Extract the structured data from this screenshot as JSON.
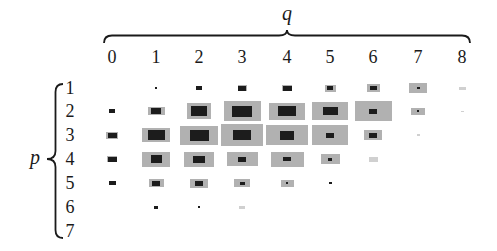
{
  "chart_data": {
    "type": "heatmap",
    "title": "",
    "xlabel": "q",
    "ylabel": "p",
    "x_ticks": [
      "0",
      "1",
      "2",
      "3",
      "4",
      "5",
      "6",
      "7",
      "8"
    ],
    "y_ticks": [
      "1",
      "2",
      "3",
      "4",
      "5",
      "6",
      "7"
    ],
    "grid": false,
    "legend": "none",
    "encoding": "each (p,q) cell drawn as a gray outer rectangle with a dark inner rectangle; sizes in px [w,h]",
    "colors": {
      "outer": "#b1b1b1",
      "outer_light": "#d0d0d0",
      "inner": "#1c1c1c"
    },
    "cells": [
      {
        "p": 1,
        "q": 1,
        "outer": [
          0,
          0
        ],
        "inner": [
          2,
          2
        ]
      },
      {
        "p": 1,
        "q": 2,
        "outer": [
          0,
          0
        ],
        "inner": [
          6,
          4
        ]
      },
      {
        "p": 1,
        "q": 3,
        "outer": [
          9,
          6
        ],
        "inner": [
          8,
          5
        ]
      },
      {
        "p": 1,
        "q": 4,
        "outer": [
          10,
          6
        ],
        "inner": [
          9,
          5
        ]
      },
      {
        "p": 1,
        "q": 5,
        "outer": [
          11,
          7
        ],
        "inner": [
          6,
          4
        ]
      },
      {
        "p": 1,
        "q": 6,
        "outer": [
          13,
          8
        ],
        "inner": [
          7,
          4
        ]
      },
      {
        "p": 1,
        "q": 7,
        "outer": [
          18,
          10
        ],
        "inner": [
          3,
          2
        ]
      },
      {
        "p": 1,
        "q": 8,
        "outer": [
          7,
          3
        ],
        "inner": [
          0,
          0
        ],
        "light": true
      },
      {
        "p": 2,
        "q": 0,
        "outer": [
          0,
          0
        ],
        "inner": [
          6,
          4
        ]
      },
      {
        "p": 2,
        "q": 1,
        "outer": [
          17,
          8
        ],
        "inner": [
          10,
          6
        ]
      },
      {
        "p": 2,
        "q": 2,
        "outer": [
          24,
          16
        ],
        "inner": [
          16,
          10
        ]
      },
      {
        "p": 2,
        "q": 3,
        "outer": [
          37,
          20
        ],
        "inner": [
          20,
          11
        ]
      },
      {
        "p": 2,
        "q": 4,
        "outer": [
          36,
          17
        ],
        "inner": [
          18,
          10
        ]
      },
      {
        "p": 2,
        "q": 5,
        "outer": [
          36,
          18
        ],
        "inner": [
          15,
          8
        ]
      },
      {
        "p": 2,
        "q": 6,
        "outer": [
          37,
          20
        ],
        "inner": [
          8,
          5
        ]
      },
      {
        "p": 2,
        "q": 7,
        "outer": [
          14,
          7
        ],
        "inner": [
          2,
          2
        ]
      },
      {
        "p": 2,
        "q": 8,
        "outer": [
          3,
          1
        ],
        "inner": [
          0,
          0
        ],
        "light": true
      },
      {
        "p": 3,
        "q": 0,
        "outer": [
          12,
          7
        ],
        "inner": [
          9,
          5
        ]
      },
      {
        "p": 3,
        "q": 1,
        "outer": [
          28,
          14
        ],
        "inner": [
          17,
          10
        ]
      },
      {
        "p": 3,
        "q": 2,
        "outer": [
          38,
          19
        ],
        "inner": [
          19,
          11
        ]
      },
      {
        "p": 3,
        "q": 3,
        "outer": [
          42,
          22
        ],
        "inner": [
          18,
          10
        ]
      },
      {
        "p": 3,
        "q": 4,
        "outer": [
          42,
          20
        ],
        "inner": [
          14,
          9
        ]
      },
      {
        "p": 3,
        "q": 5,
        "outer": [
          36,
          20
        ],
        "inner": [
          8,
          5
        ]
      },
      {
        "p": 3,
        "q": 6,
        "outer": [
          18,
          10
        ],
        "inner": [
          8,
          5
        ]
      },
      {
        "p": 3,
        "q": 7,
        "outer": [
          3,
          2
        ],
        "inner": [
          0,
          0
        ],
        "light": true
      },
      {
        "p": 4,
        "q": 0,
        "outer": [
          10,
          6
        ],
        "inner": [
          9,
          5
        ]
      },
      {
        "p": 4,
        "q": 1,
        "outer": [
          28,
          15
        ],
        "inner": [
          11,
          8
        ]
      },
      {
        "p": 4,
        "q": 2,
        "outer": [
          30,
          15
        ],
        "inner": [
          12,
          7
        ]
      },
      {
        "p": 4,
        "q": 3,
        "outer": [
          31,
          14
        ],
        "inner": [
          8,
          5
        ]
      },
      {
        "p": 4,
        "q": 4,
        "outer": [
          33,
          15
        ],
        "inner": [
          8,
          4
        ]
      },
      {
        "p": 4,
        "q": 5,
        "outer": [
          19,
          10
        ],
        "inner": [
          4,
          3
        ]
      },
      {
        "p": 4,
        "q": 6,
        "outer": [
          9,
          5
        ],
        "inner": [
          0,
          0
        ],
        "light": true
      },
      {
        "p": 5,
        "q": 0,
        "outer": [
          0,
          0
        ],
        "inner": [
          7,
          4
        ]
      },
      {
        "p": 5,
        "q": 1,
        "outer": [
          15,
          8
        ],
        "inner": [
          8,
          5
        ]
      },
      {
        "p": 5,
        "q": 2,
        "outer": [
          18,
          9
        ],
        "inner": [
          8,
          5
        ]
      },
      {
        "p": 5,
        "q": 3,
        "outer": [
          16,
          8
        ],
        "inner": [
          5,
          3
        ]
      },
      {
        "p": 5,
        "q": 4,
        "outer": [
          13,
          7
        ],
        "inner": [
          2,
          2
        ]
      },
      {
        "p": 5,
        "q": 5,
        "outer": [
          0,
          0
        ],
        "inner": [
          3,
          2
        ]
      },
      {
        "p": 6,
        "q": 1,
        "outer": [
          0,
          0
        ],
        "inner": [
          4,
          3
        ]
      },
      {
        "p": 6,
        "q": 2,
        "outer": [
          0,
          0
        ],
        "inner": [
          2,
          2
        ]
      },
      {
        "p": 6,
        "q": 3,
        "outer": [
          6,
          3
        ],
        "inner": [
          0,
          0
        ],
        "light": true
      }
    ]
  }
}
